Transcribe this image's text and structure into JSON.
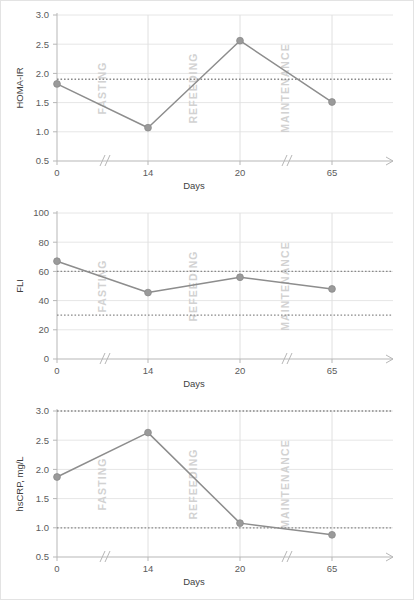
{
  "figure": {
    "panel_count": 3,
    "phase_labels": [
      "FASTING",
      "REFEEDING",
      "MAINTENANCE"
    ],
    "phase_color": "#d2d2d2",
    "line_color": "#8d8d8d",
    "marker_color": "#9a9a9a",
    "reference_line_color": "#8a8a8a",
    "grid_color": "#e6e6e6",
    "axis_color": "#b7b7b7",
    "axis_break_symbol": "//"
  },
  "chart_data": [
    {
      "type": "line",
      "title": "",
      "xlabel": "Days",
      "ylabel": "HOMA-IR",
      "x": [
        0,
        14,
        20,
        65
      ],
      "categories": [
        "0",
        "14",
        "20",
        "65"
      ],
      "values": [
        1.82,
        1.07,
        2.56,
        1.51
      ],
      "ylim": [
        0.5,
        3.0
      ],
      "yticks": [
        0.5,
        1.0,
        1.5,
        2.0,
        2.5,
        3.0
      ],
      "yticklabels": [
        "0.5",
        "1.0",
        "1.5",
        "2.0",
        "2.5",
        "3.0"
      ],
      "reference_lines": [
        1.9
      ],
      "grid": true,
      "legend": "none",
      "annotations": [
        "FASTING",
        "REFEEDING",
        "MAINTENANCE"
      ]
    },
    {
      "type": "line",
      "title": "",
      "xlabel": "Days",
      "ylabel": "FLI",
      "x": [
        0,
        14,
        20,
        65
      ],
      "categories": [
        "0",
        "14",
        "20",
        "65"
      ],
      "values": [
        67,
        45.5,
        56,
        48
      ],
      "ylim": [
        0,
        100
      ],
      "yticks": [
        0,
        20,
        40,
        60,
        80,
        100
      ],
      "yticklabels": [
        "0",
        "20",
        "40",
        "60",
        "80",
        "100"
      ],
      "reference_lines": [
        60,
        30
      ],
      "grid": true,
      "legend": "none",
      "annotations": [
        "FASTING",
        "REFEEDING",
        "MAINTENANCE"
      ]
    },
    {
      "type": "line",
      "title": "",
      "xlabel": "Days",
      "ylabel": "hsCRP, mg/L",
      "x": [
        0,
        14,
        20,
        65
      ],
      "categories": [
        "0",
        "14",
        "20",
        "65"
      ],
      "values": [
        1.87,
        2.63,
        1.08,
        0.88
      ],
      "ylim": [
        0.5,
        3.0
      ],
      "yticks": [
        0.5,
        1.0,
        1.5,
        2.0,
        2.5,
        3.0
      ],
      "yticklabels": [
        "0.5",
        "1.0",
        "1.5",
        "2.0",
        "2.5",
        "3.0"
      ],
      "reference_lines": [
        3.0,
        1.0
      ],
      "grid": true,
      "legend": "none",
      "annotations": [
        "FASTING",
        "REFEEDING",
        "MAINTENANCE"
      ]
    }
  ]
}
